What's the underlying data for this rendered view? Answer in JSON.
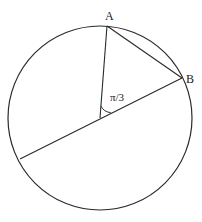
{
  "diagram": {
    "type": "circle-geometry",
    "stroke_color": "#2a2a2a",
    "background": "#ffffff",
    "circle": {
      "cx": 100,
      "cy": 118,
      "r": 92
    },
    "points": {
      "A": {
        "label": "A",
        "x": 107,
        "y": 26,
        "label_x": 105,
        "label_y": 20
      },
      "B": {
        "label": "B",
        "x": 182,
        "y": 78,
        "label_x": 186,
        "label_y": 83
      },
      "O": {
        "x": 100,
        "y": 118
      },
      "C": {
        "x": 20,
        "y": 159
      }
    },
    "angle": {
      "label": "π/3",
      "label_x": 110,
      "label_y": 101
    }
  }
}
